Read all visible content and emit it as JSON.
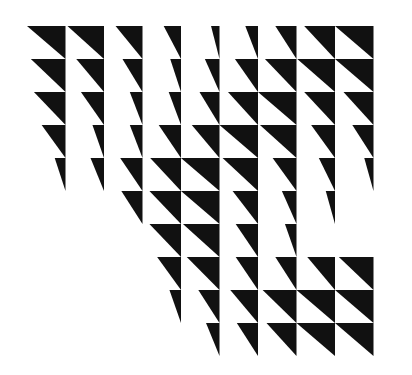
{
  "artwork": {
    "title": "Black Triangle Wave Grid",
    "kind": "op-art geometric composition",
    "background_color": "#ffffff",
    "shape_color": "#111111",
    "canvas": {
      "width": 412,
      "height": 375
    },
    "grid": {
      "columns": 9,
      "rows": 10,
      "origin_x": 27,
      "origin_y": 26,
      "cell_width": 38.5,
      "cell_height": 33.0
    },
    "shape_description": "right triangle with horizontal top edge and vertical right edge; hypotenuse runs from upper-left to lower-right",
    "cells": [
      [
        {
          "w": 1.0,
          "h": 1.0
        },
        {
          "w": 0.95,
          "h": 1.0
        },
        {
          "w": 0.7,
          "h": 1.0
        },
        {
          "w": 0.45,
          "h": 1.0
        },
        {
          "w": 0.22,
          "h": 1.0
        },
        {
          "w": 0.33,
          "h": 1.0
        },
        {
          "w": 0.55,
          "h": 1.0
        },
        {
          "w": 0.8,
          "h": 1.0
        },
        {
          "w": 1.0,
          "h": 1.0
        }
      ],
      [
        {
          "w": 0.9,
          "h": 1.0
        },
        {
          "w": 0.72,
          "h": 1.0
        },
        {
          "w": 0.52,
          "h": 1.0
        },
        {
          "w": 0.28,
          "h": 1.0
        },
        {
          "w": 0.38,
          "h": 1.0
        },
        {
          "w": 0.6,
          "h": 1.0
        },
        {
          "w": 0.82,
          "h": 1.0
        },
        {
          "w": 0.98,
          "h": 1.0
        },
        {
          "w": 1.0,
          "h": 1.0
        }
      ],
      [
        {
          "w": 0.82,
          "h": 1.0
        },
        {
          "w": 0.6,
          "h": 1.0
        },
        {
          "w": 0.33,
          "h": 1.0
        },
        {
          "w": 0.32,
          "h": 1.0
        },
        {
          "w": 0.52,
          "h": 1.0
        },
        {
          "w": 0.78,
          "h": 1.0
        },
        {
          "w": 1.0,
          "h": 1.0
        },
        {
          "w": 0.8,
          "h": 1.0
        },
        {
          "w": 0.78,
          "h": 1.0
        }
      ],
      [
        {
          "w": 0.62,
          "h": 1.0
        },
        {
          "w": 0.3,
          "h": 1.0
        },
        {
          "w": 0.33,
          "h": 1.0
        },
        {
          "w": 0.58,
          "h": 1.0
        },
        {
          "w": 0.72,
          "h": 1.0
        },
        {
          "w": 1.0,
          "h": 1.0
        },
        {
          "w": 0.95,
          "h": 1.0
        },
        {
          "w": 0.62,
          "h": 1.0
        },
        {
          "w": 0.55,
          "h": 1.0
        }
      ],
      [
        {
          "w": 0.28,
          "h": 1.0
        },
        {
          "w": 0.35,
          "h": 1.0
        },
        {
          "w": 0.58,
          "h": 1.0
        },
        {
          "w": 0.8,
          "h": 1.0
        },
        {
          "w": 1.0,
          "h": 1.0
        },
        {
          "w": 0.92,
          "h": 1.0
        },
        {
          "w": 0.62,
          "h": 1.0
        },
        {
          "w": 0.42,
          "h": 1.0
        },
        {
          "w": 0.24,
          "h": 1.0
        }
      ],
      [
        {
          "w": 0.0,
          "h": 1.0
        },
        {
          "w": 0.0,
          "h": 1.0
        },
        {
          "w": 0.55,
          "h": 1.0
        },
        {
          "w": 0.82,
          "h": 1.0
        },
        {
          "w": 1.0,
          "h": 1.0
        },
        {
          "w": 0.66,
          "h": 1.0
        },
        {
          "w": 0.38,
          "h": 1.0
        },
        {
          "w": 0.24,
          "h": 1.0
        },
        {
          "w": 0.0,
          "h": 1.0
        }
      ],
      [
        {
          "w": 0.0,
          "h": 1.0
        },
        {
          "w": 0.0,
          "h": 1.0
        },
        {
          "w": 0.0,
          "h": 1.0
        },
        {
          "w": 0.82,
          "h": 1.0
        },
        {
          "w": 0.95,
          "h": 1.0
        },
        {
          "w": 0.58,
          "h": 1.0
        },
        {
          "w": 0.3,
          "h": 1.0
        },
        {
          "w": 0.0,
          "h": 1.0
        },
        {
          "w": 0.0,
          "h": 1.0
        }
      ],
      [
        {
          "w": 0.0,
          "h": 1.0
        },
        {
          "w": 0.0,
          "h": 1.0
        },
        {
          "w": 0.0,
          "h": 1.0
        },
        {
          "w": 0.62,
          "h": 1.0
        },
        {
          "w": 0.85,
          "h": 1.0
        },
        {
          "w": 0.58,
          "h": 1.0
        },
        {
          "w": 0.55,
          "h": 1.0
        },
        {
          "w": 0.72,
          "h": 1.0
        },
        {
          "w": 0.9,
          "h": 1.0
        }
      ],
      [
        {
          "w": 0.0,
          "h": 1.0
        },
        {
          "w": 0.0,
          "h": 1.0
        },
        {
          "w": 0.0,
          "h": 1.0
        },
        {
          "w": 0.3,
          "h": 1.0
        },
        {
          "w": 0.55,
          "h": 1.0
        },
        {
          "w": 0.72,
          "h": 1.0
        },
        {
          "w": 0.88,
          "h": 1.0
        },
        {
          "w": 1.0,
          "h": 1.0
        },
        {
          "w": 1.0,
          "h": 1.0
        }
      ],
      [
        {
          "w": 0.0,
          "h": 1.0
        },
        {
          "w": 0.0,
          "h": 1.0
        },
        {
          "w": 0.0,
          "h": 1.0
        },
        {
          "w": 0.0,
          "h": 1.0
        },
        {
          "w": 0.35,
          "h": 1.0
        },
        {
          "w": 0.55,
          "h": 1.0
        },
        {
          "w": 0.78,
          "h": 1.0
        },
        {
          "w": 1.0,
          "h": 1.0
        },
        {
          "w": 1.0,
          "h": 1.0
        }
      ]
    ]
  }
}
